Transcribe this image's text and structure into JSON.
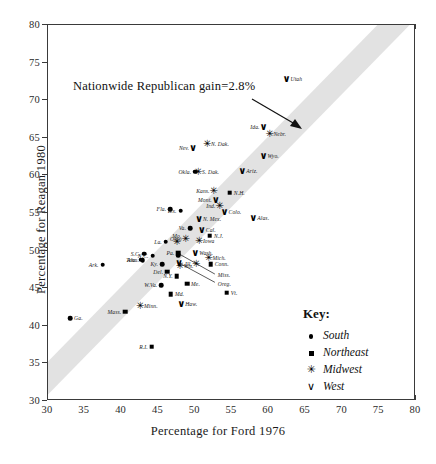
{
  "chart_data": {
    "type": "scatter",
    "title": "",
    "xlabel": "Percentage for Ford 1976",
    "ylabel": "Percentage for Reagan 1980",
    "xlim": [
      30,
      80
    ],
    "ylim": [
      30,
      80
    ],
    "xticks": [
      30,
      35,
      40,
      45,
      50,
      55,
      60,
      65,
      70,
      75,
      80
    ],
    "yticks": [
      30,
      35,
      40,
      45,
      50,
      55,
      60,
      65,
      70,
      75,
      80
    ],
    "grid": false,
    "annotation": "Nationwide Republican gain=2.8%",
    "reference_band": {
      "description": "diagonal band showing nationwide Republican gain of 2.8%",
      "color": "#e2e2e2",
      "slope": 1,
      "intercept": 2.8,
      "half_width": 2.2
    },
    "legend": {
      "position": "bottom-right-outside",
      "title": "Key:",
      "entries": [
        {
          "symbol": "circle",
          "label": "South"
        },
        {
          "symbol": "square",
          "label": "Northeast"
        },
        {
          "symbol": "asterisk",
          "label": "Midwest"
        },
        {
          "symbol": "vee",
          "label": "West"
        }
      ]
    },
    "points": [
      {
        "label": "Utah",
        "group": "West",
        "x": 62.4,
        "y": 72.8,
        "lab": "l"
      },
      {
        "label": "Ida.",
        "group": "West",
        "x": 59.3,
        "y": 66.5,
        "lab": "r"
      },
      {
        "label": "Nebr.",
        "group": "Midwest",
        "x": 60.1,
        "y": 65.5,
        "lab": "l"
      },
      {
        "label": "N. Dak.",
        "group": "Midwest",
        "x": 51.6,
        "y": 64.2,
        "lab": "l"
      },
      {
        "label": "Nev.",
        "group": "West",
        "x": 49.7,
        "y": 63.6,
        "lab": "r"
      },
      {
        "label": "Wyo.",
        "group": "West",
        "x": 59.3,
        "y": 62.6,
        "lab": "l"
      },
      {
        "label": "Okla.",
        "group": "South",
        "x": 50.0,
        "y": 60.5,
        "lab": "r"
      },
      {
        "label": "S. Dak.",
        "group": "Midwest",
        "x": 50.4,
        "y": 60.5,
        "lab": "l"
      },
      {
        "label": "Ariz.",
        "group": "West",
        "x": 56.4,
        "y": 60.6,
        "lab": "l"
      },
      {
        "label": "Kans.",
        "group": "Midwest",
        "x": 52.5,
        "y": 57.9,
        "lab": "r"
      },
      {
        "label": "N.H.",
        "group": "Northeast",
        "x": 54.7,
        "y": 57.7,
        "lab": "l"
      },
      {
        "label": "Mont.",
        "group": "West",
        "x": 52.8,
        "y": 56.8,
        "lab": "r"
      },
      {
        "label": "Ind.",
        "group": "Midwest",
        "x": 53.3,
        "y": 56.0,
        "lab": "r"
      },
      {
        "label": "Colo.",
        "group": "West",
        "x": 54.0,
        "y": 55.1,
        "lab": "l"
      },
      {
        "label": "Alas.",
        "group": "West",
        "x": 57.9,
        "y": 54.4,
        "lab": "l"
      },
      {
        "label": "Fla.",
        "group": "South",
        "x": 46.6,
        "y": 55.5,
        "lab": "r"
      },
      {
        "label": "Tex.",
        "group": "South",
        "x": 48.0,
        "y": 55.3,
        "lab": "r"
      },
      {
        "label": "N. Mex.",
        "group": "West",
        "x": 50.5,
        "y": 54.2,
        "lab": "l"
      },
      {
        "label": "Va.",
        "group": "South",
        "x": 49.3,
        "y": 53.0,
        "lab": "r"
      },
      {
        "label": "Cal.",
        "group": "West",
        "x": 50.9,
        "y": 52.7,
        "lab": "l"
      },
      {
        "label": "Ohio",
        "group": "Midwest",
        "x": 48.7,
        "y": 51.5,
        "lab": "r"
      },
      {
        "label": "N.J.",
        "group": "Northeast",
        "x": 52.0,
        "y": 52.0,
        "lab": "l"
      },
      {
        "label": "La.",
        "group": "South",
        "x": 46.0,
        "y": 51.2,
        "lab": "r"
      },
      {
        "label": "Iowa",
        "group": "Midwest",
        "x": 50.5,
        "y": 51.3,
        "lab": "l"
      },
      {
        "label": "Mo.",
        "group": "Midwest",
        "x": 47.5,
        "y": 51.2,
        "lab": "c"
      },
      {
        "label": "Wash.",
        "group": "West",
        "x": 50.0,
        "y": 49.7,
        "lab": "l"
      },
      {
        "label": "N.C.",
        "group": "South",
        "x": 44.2,
        "y": 49.3,
        "lab": "r"
      },
      {
        "label": "S.C.",
        "group": "South",
        "x": 43.1,
        "y": 49.6,
        "lab": "r"
      },
      {
        "label": "Pa.",
        "group": "Northeast",
        "x": 47.7,
        "y": 49.7,
        "lab": "r"
      },
      {
        "label": "Ala.",
        "group": "South",
        "x": 42.6,
        "y": 48.8,
        "lab": "r"
      },
      {
        "label": "Tenn.",
        "group": "South",
        "x": 42.9,
        "y": 48.7,
        "lab": "r"
      },
      {
        "label": "Mich.",
        "group": "Midwest",
        "x": 51.8,
        "y": 49.0,
        "lab": "l"
      },
      {
        "label": "Ill.",
        "group": "Midwest",
        "x": 50.1,
        "y": 48.2,
        "lab": "r"
      },
      {
        "label": "Conn.",
        "group": "Northeast",
        "x": 52.1,
        "y": 48.2,
        "lab": "l"
      },
      {
        "label": "Ky.",
        "group": "South",
        "x": 45.5,
        "y": 48.2,
        "lab": "r"
      },
      {
        "label": "Ark.",
        "group": "South",
        "x": 37.4,
        "y": 48.1,
        "lab": "r"
      },
      {
        "label": "Del.",
        "group": "Northeast",
        "x": 46.2,
        "y": 47.2,
        "lab": "r"
      },
      {
        "label": "Wis.",
        "group": "Midwest",
        "x": 47.9,
        "y": 47.9,
        "lab": "l"
      },
      {
        "label": "N.Y.",
        "group": "Northeast",
        "x": 47.5,
        "y": 46.6,
        "lab": "r"
      },
      {
        "label": "Me.",
        "group": "Northeast",
        "x": 48.9,
        "y": 45.6,
        "lab": "l"
      },
      {
        "label": "W.Va.",
        "group": "South",
        "x": 45.4,
        "y": 45.4,
        "lab": "r"
      },
      {
        "label": "Minn.",
        "group": "Midwest",
        "x": 42.5,
        "y": 42.6,
        "lab": "l"
      },
      {
        "label": "Mass.",
        "group": "Northeast",
        "x": 40.5,
        "y": 41.9,
        "lab": "r"
      },
      {
        "label": "Md.",
        "group": "Northeast",
        "x": 46.7,
        "y": 44.2,
        "lab": "l"
      },
      {
        "label": "Haw.",
        "group": "West",
        "x": 48.1,
        "y": 42.9,
        "lab": "l"
      },
      {
        "label": "Vt.",
        "group": "Northeast",
        "x": 54.3,
        "y": 44.4,
        "lab": "l"
      },
      {
        "label": "Ga.",
        "group": "South",
        "x": 33.0,
        "y": 41.0,
        "lab": "l"
      },
      {
        "label": "R.I.",
        "group": "Northeast",
        "x": 44.1,
        "y": 37.2,
        "lab": "r"
      },
      {
        "label": "Oreg.",
        "group": "West",
        "x": 47.8,
        "y": 48.3,
        "lab": "none"
      },
      {
        "label": "Miss.",
        "group": "South",
        "x": 47.7,
        "y": 49.4,
        "lab": "none"
      }
    ],
    "leader_labels": [
      {
        "label": "Miss.",
        "text_x": 52.8,
        "text_y": 46.7,
        "point_x": 47.9,
        "point_y": 49.4
      },
      {
        "label": "Oreg.",
        "text_x": 52.8,
        "text_y": 45.6,
        "point_x": 47.7,
        "point_y": 48.3
      }
    ]
  }
}
